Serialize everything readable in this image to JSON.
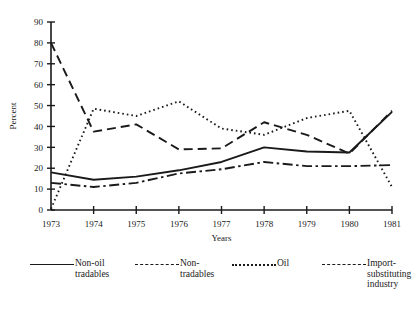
{
  "chart_data": {
    "type": "line",
    "title": "",
    "xlabel": "Years",
    "ylabel": "Percent",
    "x": [
      1973,
      1974,
      1975,
      1976,
      1977,
      1978,
      1979,
      1980,
      1981
    ],
    "categories": [
      "1973",
      "1974",
      "1975",
      "1976",
      "1977",
      "1978",
      "1979",
      "1980",
      "1981"
    ],
    "xlim": [
      1973,
      1981
    ],
    "ylim": [
      0,
      90
    ],
    "yticks": [
      0,
      10,
      20,
      30,
      40,
      50,
      60,
      70,
      80,
      90
    ],
    "xticks": [
      "1973",
      "1974",
      "1975",
      "1976",
      "1977",
      "1978",
      "1979",
      "1980",
      "1981"
    ],
    "grid": false,
    "legend_position": "bottom",
    "series": [
      {
        "name": "Non-oil tradables",
        "label": "Non-oil\ntradables",
        "style": "solid",
        "color": "#1a1a1a",
        "values": [
          18,
          14.5,
          16,
          19,
          23,
          30,
          28,
          27.5,
          47
        ]
      },
      {
        "name": "Non-tradables",
        "label": "Non-\ntradables",
        "style": "dashed",
        "color": "#1a1a1a",
        "values": [
          80,
          37.5,
          41,
          29,
          29.5,
          42,
          36,
          27,
          47.5
        ]
      },
      {
        "name": "Oil",
        "label": "Oil",
        "style": "dotted",
        "color": "#1a1a1a",
        "values": [
          0.5,
          48.5,
          45,
          52,
          39,
          36,
          44,
          47.5,
          11
        ]
      },
      {
        "name": "Import-substituting industry",
        "label": "Import-\nsubstituting\nindustry",
        "style": "dashdot",
        "color": "#1a1a1a",
        "values": [
          13,
          11,
          13,
          17.5,
          19.5,
          23,
          21,
          21,
          21.5
        ]
      }
    ]
  },
  "legend": {
    "items": [
      {
        "key": "non-oil-tradables",
        "label": "Non-oil\ntradables",
        "style": "solid"
      },
      {
        "key": "non-tradables",
        "label": "Non-\ntradables",
        "style": "dashed"
      },
      {
        "key": "oil",
        "label": "Oil",
        "style": "dotted"
      },
      {
        "key": "import-substituting-industry",
        "label": "Import-\nsubstituting\nindustry",
        "style": "dashdot"
      }
    ]
  }
}
